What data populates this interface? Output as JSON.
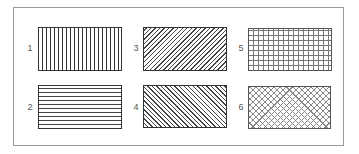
{
  "figure": {
    "title": "",
    "swatches": [
      {
        "label": "1",
        "pattern": "vertical-lines",
        "color": "#333333"
      },
      {
        "label": "2",
        "pattern": "horizontal-lines",
        "color": "#444444"
      },
      {
        "label": "3",
        "pattern": "diagonal-forward",
        "color": "#444444"
      },
      {
        "label": "4",
        "pattern": "diagonal-back",
        "color": "#444444"
      },
      {
        "label": "5",
        "pattern": "square-grid",
        "color": "#777777"
      },
      {
        "label": "6",
        "pattern": "diagonal-crosshatch",
        "color": "#888888"
      }
    ]
  }
}
